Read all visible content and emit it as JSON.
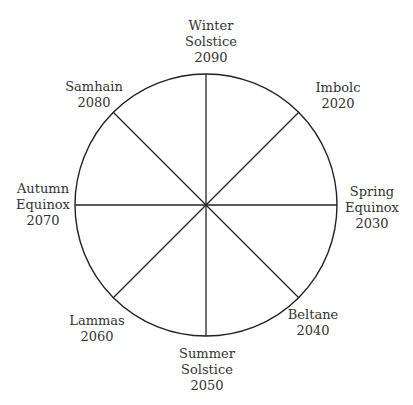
{
  "diagram": {
    "title": "",
    "center": [
      206,
      205
    ],
    "radius": 131,
    "stroke_color": "#222222",
    "nodes": [
      {
        "lines": [
          "Winter",
          "Solstice",
          "2090"
        ],
        "x": 211,
        "y": 18
      },
      {
        "lines": [
          "Imbolc",
          "2020"
        ],
        "x": 338,
        "y": 80
      },
      {
        "lines": [
          "Spring",
          "Equinox",
          "2030"
        ],
        "x": 366,
        "y": 184
      },
      {
        "lines": [
          "Beltane",
          "2040"
        ],
        "x": 313,
        "y": 307
      },
      {
        "lines": [
          "Summer",
          "Solstice",
          "2050"
        ],
        "x": 207,
        "y": 346
      },
      {
        "lines": [
          "Lammas",
          "2060"
        ],
        "x": 97,
        "y": 313
      },
      {
        "lines": [
          "Autumn",
          "Equinox",
          "2070"
        ],
        "x": 43,
        "y": 181
      },
      {
        "lines": [
          "Samhain",
          "2080"
        ],
        "x": 94,
        "y": 79
      }
    ]
  }
}
